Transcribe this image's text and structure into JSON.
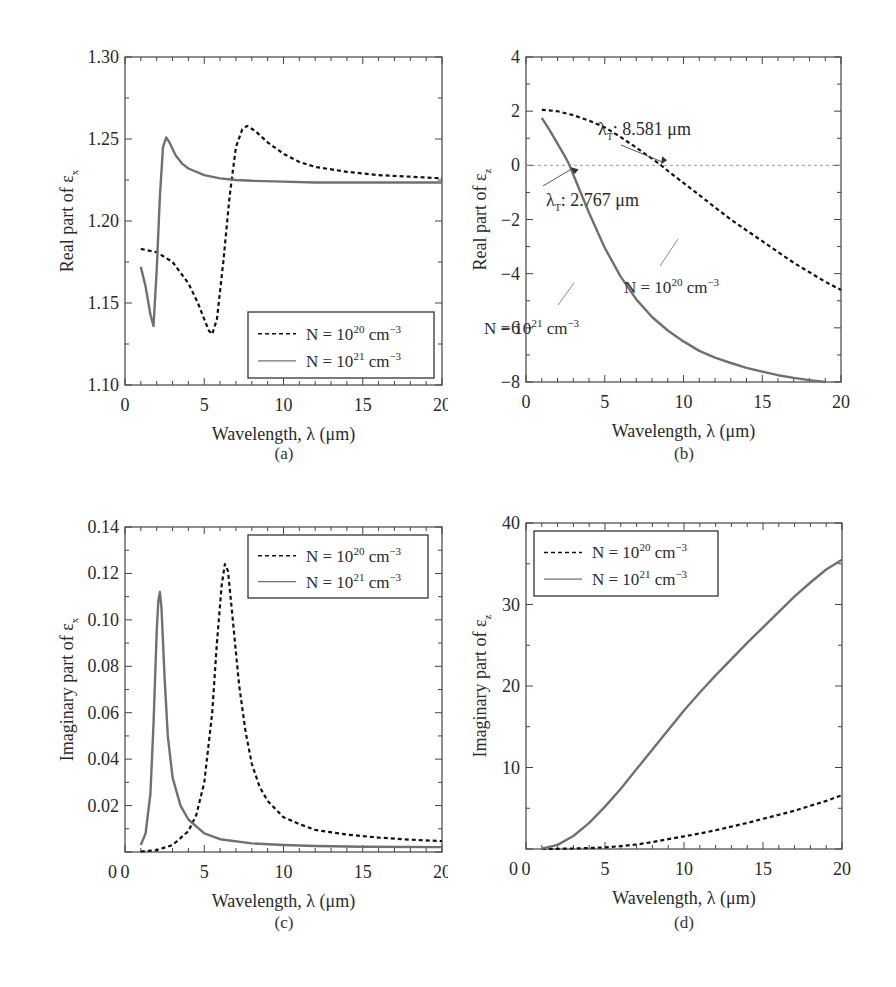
{
  "figure": {
    "panels": [
      {
        "id": "a",
        "caption": "(a)"
      },
      {
        "id": "b",
        "caption": "(b)"
      },
      {
        "id": "c",
        "caption": "(c)"
      },
      {
        "id": "d",
        "caption": "(d)"
      }
    ]
  },
  "legend": {
    "n20": "N = 10",
    "n20_exp": "20",
    "n21": "N = 10",
    "n21_exp": "21",
    "unit": " cm",
    "unit_exp": "−3"
  },
  "colors": {
    "n20_line": "#111111",
    "n21_line": "#707070",
    "axis": "#444444",
    "zero_line": "#9a9a9a"
  },
  "chart_data": [
    {
      "id": "a",
      "type": "line",
      "title": "",
      "xlabel": "Wavelength, λ (μm)",
      "ylabel": "Real part of εx",
      "xlim": [
        0,
        20
      ],
      "ylim": [
        1.1,
        1.3
      ],
      "xticks": [
        0,
        5,
        10,
        15,
        20
      ],
      "yticks": [
        1.1,
        1.15,
        1.2,
        1.25,
        1.3
      ],
      "ytick_labels": [
        "1.10",
        "1.15",
        "1.20",
        "1.25",
        "1.30"
      ],
      "legend_position": "lower right",
      "series": [
        {
          "name": "N = 10^20 cm^-3",
          "style": "dashed",
          "x": [
            1.0,
            2.0,
            3.0,
            4.0,
            4.6,
            5.0,
            5.3,
            5.5,
            5.8,
            6.2,
            6.6,
            7.0,
            7.4,
            7.7,
            8.2,
            9.0,
            10.0,
            11.0,
            12.0,
            14.0,
            16.0,
            18.0,
            20.0
          ],
          "y": [
            1.183,
            1.181,
            1.175,
            1.162,
            1.15,
            1.14,
            1.133,
            1.131,
            1.14,
            1.175,
            1.215,
            1.245,
            1.256,
            1.258,
            1.255,
            1.248,
            1.241,
            1.236,
            1.233,
            1.23,
            1.228,
            1.227,
            1.226
          ]
        },
        {
          "name": "N = 10^21 cm^-3",
          "style": "solid",
          "x": [
            1.0,
            1.3,
            1.6,
            1.8,
            2.0,
            2.2,
            2.4,
            2.6,
            2.8,
            3.2,
            3.6,
            4.0,
            5.0,
            6.0,
            7.0,
            8.0,
            10.0,
            12.0,
            15.0,
            20.0
          ],
          "y": [
            1.172,
            1.16,
            1.143,
            1.136,
            1.17,
            1.215,
            1.245,
            1.251,
            1.248,
            1.24,
            1.235,
            1.232,
            1.228,
            1.226,
            1.225,
            1.2245,
            1.224,
            1.2235,
            1.2235,
            1.2235
          ]
        }
      ]
    },
    {
      "id": "b",
      "type": "line",
      "title": "",
      "xlabel": "Wavelength, λ (μm)",
      "ylabel": "Real part of εz",
      "xlim": [
        0,
        20
      ],
      "ylim": [
        -8,
        4
      ],
      "xticks": [
        0,
        5,
        10,
        15,
        20
      ],
      "yticks": [
        -8,
        -6,
        -4,
        -2,
        0,
        2,
        4
      ],
      "ytick_labels": [
        "−8",
        "−6",
        "−4",
        "−2",
        "0",
        "2",
        "4"
      ],
      "annotations": [
        {
          "text": "λT: 8.581 μm",
          "x": 8.581,
          "y": 0
        },
        {
          "text": "λT: 2.767 μm",
          "x": 2.767,
          "y": 0
        },
        {
          "text": "N = 10^20 cm^-3",
          "target_series": 0
        },
        {
          "text": "N = 10^21 cm^-3",
          "target_series": 1
        }
      ],
      "series": [
        {
          "name": "N = 10^20 cm^-3",
          "style": "dashed",
          "x": [
            1,
            2,
            3,
            4,
            5,
            6,
            7,
            8,
            8.581,
            9,
            10,
            11,
            12,
            13,
            14,
            15,
            16,
            17,
            18,
            19,
            20
          ],
          "y": [
            2.05,
            2.0,
            1.85,
            1.65,
            1.4,
            1.05,
            0.65,
            0.25,
            0.0,
            -0.2,
            -0.65,
            -1.1,
            -1.55,
            -2.0,
            -2.4,
            -2.8,
            -3.2,
            -3.6,
            -3.95,
            -4.3,
            -4.6
          ]
        },
        {
          "name": "N = 10^21 cm^-3",
          "style": "solid",
          "x": [
            1,
            1.5,
            2,
            2.5,
            2.767,
            3,
            4,
            5,
            6,
            7,
            8,
            9,
            10,
            11,
            12,
            13,
            14,
            15,
            16,
            17,
            18,
            19
          ],
          "y": [
            1.75,
            1.3,
            0.8,
            0.3,
            0.0,
            -0.35,
            -1.75,
            -3.05,
            -4.1,
            -4.95,
            -5.6,
            -6.1,
            -6.5,
            -6.85,
            -7.1,
            -7.3,
            -7.48,
            -7.62,
            -7.75,
            -7.85,
            -7.93,
            -8.0
          ]
        }
      ]
    },
    {
      "id": "c",
      "type": "line",
      "title": "",
      "xlabel": "Wavelength, λ (μm)",
      "ylabel": "Imaginary part of εx",
      "xlim": [
        0,
        20
      ],
      "ylim": [
        0,
        0.14
      ],
      "xticks": [
        0,
        5,
        10,
        15,
        20
      ],
      "yticks": [
        0.02,
        0.04,
        0.06,
        0.08,
        0.1,
        0.12,
        0.14
      ],
      "ytick_labels": [
        "0.02",
        "0.04",
        "0.06",
        "0.08",
        "0.10",
        "0.12",
        "0.14"
      ],
      "legend_position": "upper right",
      "series": [
        {
          "name": "N = 10^20 cm^-3",
          "style": "dashed",
          "x": [
            1.0,
            2.0,
            3.0,
            4.0,
            4.5,
            5.0,
            5.5,
            5.8,
            6.1,
            6.3,
            6.5,
            6.8,
            7.2,
            7.6,
            8.0,
            8.5,
            9.0,
            10.0,
            11.0,
            12.0,
            14.0,
            16.0,
            18.0,
            20.0
          ],
          "y": [
            0.0002,
            0.0008,
            0.003,
            0.009,
            0.016,
            0.03,
            0.06,
            0.09,
            0.115,
            0.124,
            0.121,
            0.1,
            0.072,
            0.052,
            0.038,
            0.028,
            0.022,
            0.015,
            0.012,
            0.0095,
            0.0075,
            0.0062,
            0.0053,
            0.0047
          ]
        },
        {
          "name": "N = 10^21 cm^-3",
          "style": "solid",
          "x": [
            1.0,
            1.3,
            1.6,
            1.8,
            2.0,
            2.1,
            2.2,
            2.3,
            2.5,
            2.7,
            3.0,
            3.5,
            4.0,
            5.0,
            6.0,
            8.0,
            10.0,
            12.0,
            15.0,
            20.0
          ],
          "y": [
            0.003,
            0.008,
            0.025,
            0.055,
            0.095,
            0.108,
            0.112,
            0.105,
            0.075,
            0.05,
            0.032,
            0.02,
            0.014,
            0.008,
            0.0055,
            0.0037,
            0.003,
            0.0026,
            0.0023,
            0.0021
          ]
        }
      ]
    },
    {
      "id": "d",
      "type": "line",
      "title": "",
      "xlabel": "Wavelength, λ (μm)",
      "ylabel": "Imaginary part of εz",
      "xlim": [
        0,
        20
      ],
      "ylim": [
        0,
        40
      ],
      "xticks": [
        0,
        5,
        10,
        15,
        20
      ],
      "yticks": [
        10,
        20,
        30,
        40
      ],
      "ytick_labels": [
        "10",
        "20",
        "30",
        "40"
      ],
      "legend_position": "upper left",
      "series": [
        {
          "name": "N = 10^20 cm^-3",
          "style": "dashed",
          "x": [
            1,
            2,
            3,
            4,
            5,
            6,
            7,
            8,
            9,
            10,
            11,
            12,
            13,
            14,
            15,
            16,
            17,
            18,
            19,
            20
          ],
          "y": [
            0.0,
            0.02,
            0.06,
            0.12,
            0.2,
            0.35,
            0.55,
            0.85,
            1.2,
            1.55,
            1.9,
            2.3,
            2.75,
            3.2,
            3.7,
            4.2,
            4.7,
            5.3,
            5.9,
            6.6
          ]
        },
        {
          "name": "N = 10^21 cm^-3",
          "style": "solid",
          "x": [
            1,
            2,
            3,
            4,
            5,
            6,
            7,
            8,
            9,
            10,
            11,
            12,
            13,
            14,
            15,
            16,
            17,
            18,
            19,
            20
          ],
          "y": [
            0.05,
            0.5,
            1.6,
            3.2,
            5.2,
            7.4,
            9.8,
            12.2,
            14.6,
            17.0,
            19.2,
            21.3,
            23.3,
            25.3,
            27.2,
            29.1,
            31.0,
            32.7,
            34.3,
            35.5
          ]
        }
      ]
    }
  ]
}
